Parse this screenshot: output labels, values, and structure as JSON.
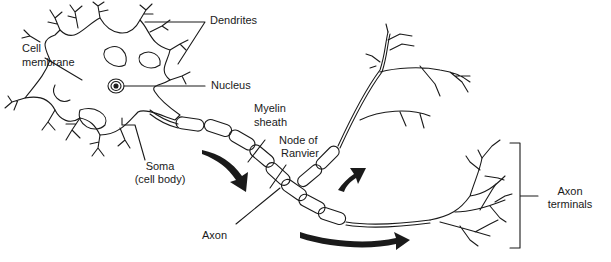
{
  "diagram": {
    "labels": {
      "dendrites": "Dendrites",
      "cell_membrane_1": "Cell",
      "cell_membrane_2": "membrane",
      "nucleus": "Nucleus",
      "myelin_1": "Myelin",
      "myelin_2": "sheath",
      "node_1": "Node of",
      "node_2": "Ranvier",
      "soma_1": "Soma",
      "soma_2": "(cell body)",
      "axon": "Axon",
      "terminals_1": "Axon",
      "terminals_2": "terminals"
    },
    "colors": {
      "line": "#1a1a1a",
      "background": "#ffffff"
    }
  }
}
